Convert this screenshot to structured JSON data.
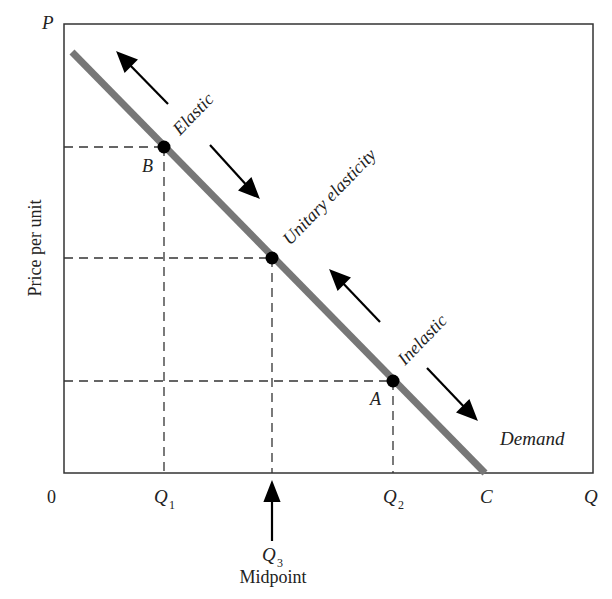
{
  "diagram": {
    "axes": {
      "y_axis_symbol": "P",
      "y_axis_label": "Price per unit",
      "x_axis_symbol": "Q",
      "origin_label": "0"
    },
    "x_ticks": {
      "q1": "Q",
      "q1_sub": "1",
      "q2": "Q",
      "q2_sub": "2",
      "c": "C"
    },
    "midpoint_marker": {
      "symbol": "Q",
      "sub": "3",
      "label": "Midpoint"
    },
    "curve_label": "Demand",
    "points": {
      "b": "B",
      "a": "A"
    },
    "region_labels": {
      "elastic": "Elastic",
      "unitary": "Unitary elasticity",
      "inelastic": "Inelastic"
    },
    "colors": {
      "demand_line": "#777777",
      "axis": "#333333",
      "dashed": "#333333",
      "point": "#000000"
    }
  }
}
